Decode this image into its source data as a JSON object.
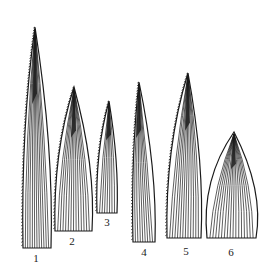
{
  "figure": {
    "background": "#ffffff",
    "ink": "#1a1a1a",
    "leaves": [
      {
        "label": "1",
        "tip": [
          35,
          27
        ],
        "base_left": [
          23,
          248
        ],
        "base_right": [
          51,
          248
        ],
        "veins": 12,
        "serrate": "left",
        "label_pos": [
          36,
          262
        ]
      },
      {
        "label": "2",
        "tip": [
          74,
          87
        ],
        "base_left": [
          55,
          231
        ],
        "base_right": [
          92,
          231
        ],
        "veins": 14,
        "serrate": "left",
        "label_pos": [
          72,
          245
        ]
      },
      {
        "label": "3",
        "tip": [
          109,
          101
        ],
        "base_left": [
          97,
          213
        ],
        "base_right": [
          117,
          213
        ],
        "veins": 8,
        "serrate": "left",
        "label_pos": [
          107,
          226
        ]
      },
      {
        "label": "4",
        "tip": [
          139,
          82
        ],
        "base_left": [
          133,
          242
        ],
        "base_right": [
          155,
          242
        ],
        "veins": 9,
        "serrate": "left",
        "label_pos": [
          144,
          256
        ]
      },
      {
        "label": "5",
        "tip": [
          188,
          73
        ],
        "base_left": [
          167,
          238
        ],
        "base_right": [
          201,
          238
        ],
        "veins": 13,
        "serrate": "left",
        "label_pos": [
          186,
          255
        ]
      },
      {
        "label": "6",
        "tip": [
          234,
          132
        ],
        "base_left": [
          207,
          238
        ],
        "base_right": [
          256,
          238
        ],
        "veins": 17,
        "serrate": "none",
        "label_pos": [
          231,
          256
        ]
      }
    ]
  }
}
